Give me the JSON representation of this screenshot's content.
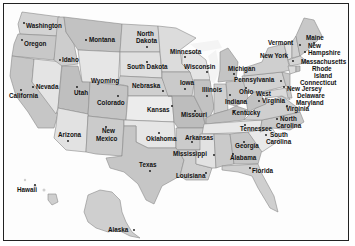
{
  "map": {
    "title": "United States map with state names and capitals",
    "colors": {
      "light": "#e9e9e9",
      "mid": "#cfcfcf",
      "dark": "#b8b8b8",
      "water": "#fdfdfd",
      "border": "#222222",
      "text": "#111111"
    },
    "states": [
      {
        "name": "Washington",
        "x": 26,
        "y": 28
      },
      {
        "name": "Oregon",
        "x": 24,
        "y": 45
      },
      {
        "name": "Idaho",
        "x": 62,
        "y": 61
      },
      {
        "name": "Montana",
        "x": 88,
        "y": 42
      },
      {
        "name": "Wyoming",
        "x": 91,
        "y": 82
      },
      {
        "name": "Nevada",
        "x": 37,
        "y": 89
      },
      {
        "name": "California",
        "x": 10,
        "y": 98
      },
      {
        "name": "Utah",
        "x": 74,
        "y": 96
      },
      {
        "name": "Colorado",
        "x": 97,
        "y": 104
      },
      {
        "name": "Arizona",
        "x": 58,
        "y": 136
      },
      {
        "name": "New",
        "x": 102,
        "y": 133
      },
      {
        "name": "Mexico",
        "x": 97,
        "y": 141
      },
      {
        "name": "North",
        "x": 137,
        "y": 35
      },
      {
        "name": "Dakota",
        "x": 136,
        "y": 42
      },
      {
        "name": "South Dakota",
        "x": 127,
        "y": 68
      },
      {
        "name": "Minnesota",
        "x": 170,
        "y": 54
      },
      {
        "name": "Wisconsin",
        "x": 184,
        "y": 68
      },
      {
        "name": "Nebraska",
        "x": 132,
        "y": 87
      },
      {
        "name": "Iowa",
        "x": 180,
        "y": 84
      },
      {
        "name": "Kansas",
        "x": 147,
        "y": 112
      },
      {
        "name": "Missouri",
        "x": 181,
        "y": 117
      },
      {
        "name": "Illinois",
        "x": 203,
        "y": 91
      },
      {
        "name": "Michigan",
        "x": 228,
        "y": 70
      },
      {
        "name": "Indiana",
        "x": 225,
        "y": 104
      },
      {
        "name": "Ohio",
        "x": 239,
        "y": 94
      },
      {
        "name": "Kentucky",
        "x": 233,
        "y": 114
      },
      {
        "name": "Oklahoma",
        "x": 146,
        "y": 140
      },
      {
        "name": "Arkansas",
        "x": 185,
        "y": 139
      },
      {
        "name": "Tennessee",
        "x": 239,
        "y": 131
      },
      {
        "name": "Texas",
        "x": 139,
        "y": 167
      },
      {
        "name": "Louisiana",
        "x": 176,
        "y": 177
      },
      {
        "name": "Mississippi",
        "x": 173,
        "y": 155
      },
      {
        "name": "Alabama",
        "x": 231,
        "y": 160
      },
      {
        "name": "Georgia",
        "x": 234,
        "y": 148
      },
      {
        "name": "Florida",
        "x": 252,
        "y": 172
      },
      {
        "name": "South",
        "x": 268,
        "y": 137
      },
      {
        "name": "Carolina",
        "x": 266,
        "y": 144
      },
      {
        "name": "North",
        "x": 280,
        "y": 120
      },
      {
        "name": "Carolina",
        "x": 275,
        "y": 127
      },
      {
        "name": "Virginia",
        "x": 286,
        "y": 111
      },
      {
        "name": "West",
        "x": 255,
        "y": 95
      },
      {
        "name": "Virginia",
        "x": 262,
        "y": 102
      },
      {
        "name": "Pennsylvania",
        "x": 234,
        "y": 82
      },
      {
        "name": "New York",
        "x": 262,
        "y": 58
      },
      {
        "name": "Vermont",
        "x": 268,
        "y": 45
      },
      {
        "name": "Maine",
        "x": 306,
        "y": 40
      },
      {
        "name": "New",
        "x": 308,
        "y": 48
      },
      {
        "name": "Hampshire",
        "x": 308,
        "y": 55
      },
      {
        "name": "Massachusetts",
        "x": 300,
        "y": 64
      },
      {
        "name": "Rhode",
        "x": 312,
        "y": 71
      },
      {
        "name": "Island",
        "x": 314,
        "y": 78
      },
      {
        "name": "Connecticut",
        "x": 300,
        "y": 85
      },
      {
        "name": "New Jersey",
        "x": 287,
        "y": 91
      },
      {
        "name": "Delaware",
        "x": 297,
        "y": 98
      },
      {
        "name": "Maryland",
        "x": 296,
        "y": 104
      },
      {
        "name": "Hawaii",
        "x": 17,
        "y": 192
      },
      {
        "name": "Alaska",
        "x": 108,
        "y": 232
      }
    ],
    "labels": {
      "washington": "Washington",
      "oregon": "Oregon",
      "idaho": "Idaho",
      "montana": "Montana",
      "wyoming": "Wyoming",
      "nevada": "Nevada",
      "california": "California",
      "utah": "Utah",
      "colorado": "Colorado",
      "arizona": "Arizona",
      "new_mexico_1": "New",
      "new_mexico_2": "Mexico",
      "north_dakota_1": "North",
      "north_dakota_2": "Dakota",
      "south_dakota": "South Dakota",
      "minnesota": "Minnesota",
      "wisconsin": "Wisconsin",
      "nebraska": "Nebraska",
      "iowa": "Iowa",
      "kansas": "Kansas",
      "missouri": "Missouri",
      "illinois": "Illinois",
      "michigan": "Michigan",
      "indiana": "Indiana",
      "ohio": "Ohio",
      "kentucky": "Kentucky",
      "oklahoma": "Oklahoma",
      "arkansas": "Arkansas",
      "tennessee": "Tennessee",
      "texas": "Texas",
      "louisiana": "Louisiana",
      "mississippi": "Mississippi",
      "alabama": "Alabama",
      "georgia": "Georgia",
      "florida": "Florida",
      "south_carolina_1": "South",
      "south_carolina_2": "Carolina",
      "north_carolina_1": "North",
      "north_carolina_2": "Carolina",
      "virginia": "Virginia",
      "west_virginia_1": "West",
      "west_virginia_2": "Virginia",
      "pennsylvania": "Pennsylvania",
      "new_york": "New York",
      "vermont": "Vermont",
      "maine": "Maine",
      "new_hampshire_1": "New",
      "new_hampshire_2": "Hampshire",
      "massachusetts": "Massachusetts",
      "rhode_island_1": "Rhode",
      "rhode_island_2": "Island",
      "connecticut": "Connecticut",
      "new_jersey": "New Jersey",
      "delaware": "Delaware",
      "maryland": "Maryland",
      "hawaii": "Hawaii",
      "alaska": "Alaska"
    }
  }
}
